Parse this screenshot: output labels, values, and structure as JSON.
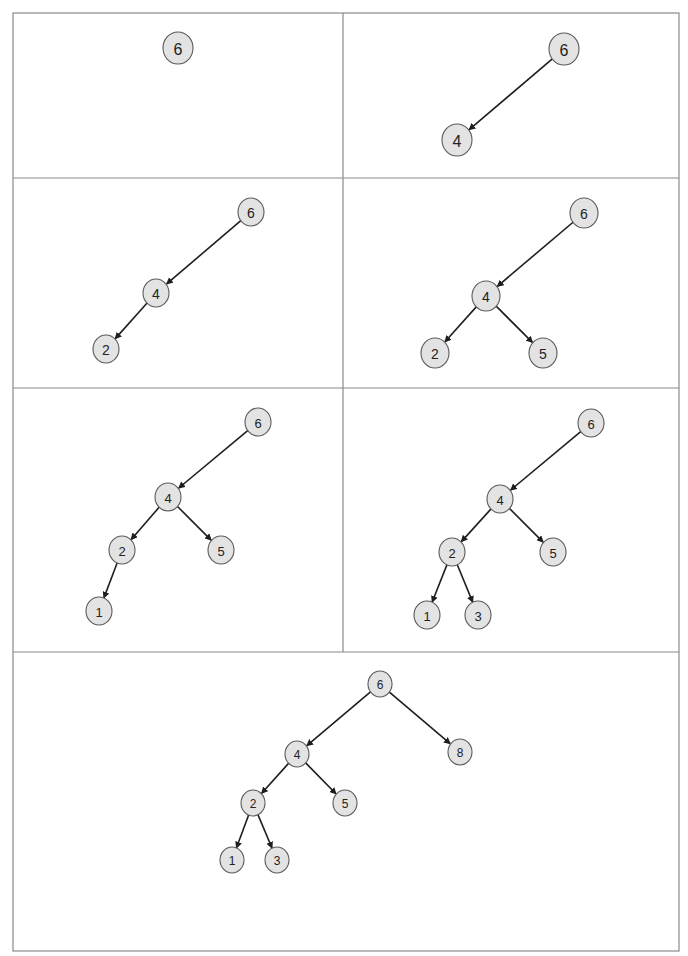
{
  "diagram": {
    "insert_order": [
      "6",
      "4",
      "2",
      "5",
      "1",
      "3",
      "8"
    ],
    "colors": {
      "node_fill": "#e3e3e3",
      "node_stroke": "#5a5a5a",
      "edge": "#1e1e1e",
      "frame": "#8a8a8a",
      "text": "#222222"
    },
    "frame": {
      "outer": {
        "x": 13,
        "y": 13,
        "w": 666,
        "h": 938
      },
      "vertical_divider": {
        "x": 343,
        "y1": 13,
        "y2": 652
      },
      "horizontal_dividers": [
        178,
        388,
        652
      ]
    },
    "panels": [
      {
        "step": 1,
        "inserted": "6",
        "radius": 15,
        "font_size": 16,
        "nodes": [
          {
            "id": "6",
            "label": "6",
            "x": 178,
            "y": 48
          }
        ],
        "edges": []
      },
      {
        "step": 2,
        "inserted": "4",
        "radius": 15,
        "font_size": 16,
        "nodes": [
          {
            "id": "6",
            "label": "6",
            "x": 564,
            "y": 49
          },
          {
            "id": "4",
            "label": "4",
            "x": 457,
            "y": 140
          }
        ],
        "edges": [
          {
            "from": "6",
            "to": "4"
          }
        ]
      },
      {
        "step": 3,
        "inserted": "2",
        "radius": 13,
        "font_size": 14,
        "nodes": [
          {
            "id": "6",
            "label": "6",
            "x": 251,
            "y": 212
          },
          {
            "id": "4",
            "label": "4",
            "x": 156,
            "y": 293
          },
          {
            "id": "2",
            "label": "2",
            "x": 106,
            "y": 349
          }
        ],
        "edges": [
          {
            "from": "6",
            "to": "4"
          },
          {
            "from": "4",
            "to": "2"
          }
        ]
      },
      {
        "step": 4,
        "inserted": "5",
        "radius": 14,
        "font_size": 14,
        "nodes": [
          {
            "id": "6",
            "label": "6",
            "x": 584,
            "y": 213
          },
          {
            "id": "4",
            "label": "4",
            "x": 486,
            "y": 296
          },
          {
            "id": "2",
            "label": "2",
            "x": 435,
            "y": 353
          },
          {
            "id": "5",
            "label": "5",
            "x": 543,
            "y": 353
          }
        ],
        "edges": [
          {
            "from": "6",
            "to": "4"
          },
          {
            "from": "4",
            "to": "2"
          },
          {
            "from": "4",
            "to": "5"
          }
        ]
      },
      {
        "step": 5,
        "inserted": "1",
        "radius": 13,
        "font_size": 13,
        "nodes": [
          {
            "id": "6",
            "label": "6",
            "x": 258,
            "y": 422
          },
          {
            "id": "4",
            "label": "4",
            "x": 168,
            "y": 497
          },
          {
            "id": "2",
            "label": "2",
            "x": 122,
            "y": 550
          },
          {
            "id": "5",
            "label": "5",
            "x": 221,
            "y": 550
          },
          {
            "id": "1",
            "label": "1",
            "x": 99,
            "y": 611
          }
        ],
        "edges": [
          {
            "from": "6",
            "to": "4"
          },
          {
            "from": "4",
            "to": "2"
          },
          {
            "from": "4",
            "to": "5"
          },
          {
            "from": "2",
            "to": "1"
          }
        ]
      },
      {
        "step": 6,
        "inserted": "3",
        "radius": 13,
        "font_size": 13,
        "nodes": [
          {
            "id": "6",
            "label": "6",
            "x": 591,
            "y": 423
          },
          {
            "id": "4",
            "label": "4",
            "x": 500,
            "y": 499
          },
          {
            "id": "2",
            "label": "2",
            "x": 452,
            "y": 552
          },
          {
            "id": "5",
            "label": "5",
            "x": 553,
            "y": 552
          },
          {
            "id": "1",
            "label": "1",
            "x": 427,
            "y": 615
          },
          {
            "id": "3",
            "label": "3",
            "x": 478,
            "y": 615
          }
        ],
        "edges": [
          {
            "from": "6",
            "to": "4"
          },
          {
            "from": "4",
            "to": "2"
          },
          {
            "from": "4",
            "to": "5"
          },
          {
            "from": "2",
            "to": "1"
          },
          {
            "from": "2",
            "to": "3"
          }
        ]
      },
      {
        "step": 7,
        "inserted": "8",
        "radius": 12,
        "font_size": 12,
        "nodes": [
          {
            "id": "6",
            "label": "6",
            "x": 380,
            "y": 684
          },
          {
            "id": "4",
            "label": "4",
            "x": 297,
            "y": 754
          },
          {
            "id": "8",
            "label": "8",
            "x": 460,
            "y": 752
          },
          {
            "id": "2",
            "label": "2",
            "x": 253,
            "y": 803
          },
          {
            "id": "5",
            "label": "5",
            "x": 345,
            "y": 803
          },
          {
            "id": "1",
            "label": "1",
            "x": 232,
            "y": 860
          },
          {
            "id": "3",
            "label": "3",
            "x": 277,
            "y": 860
          }
        ],
        "edges": [
          {
            "from": "6",
            "to": "4"
          },
          {
            "from": "6",
            "to": "8"
          },
          {
            "from": "4",
            "to": "2"
          },
          {
            "from": "4",
            "to": "5"
          },
          {
            "from": "2",
            "to": "1"
          },
          {
            "from": "2",
            "to": "3"
          }
        ]
      }
    ]
  }
}
